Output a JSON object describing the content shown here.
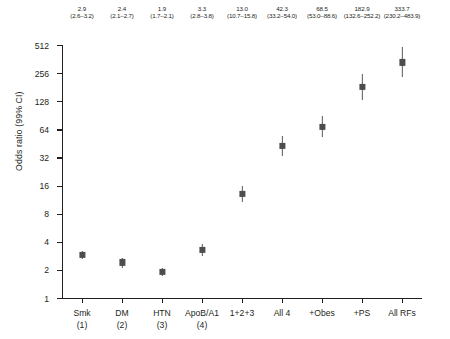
{
  "chart_data": {
    "type": "scatter",
    "title": "",
    "xlabel": "",
    "ylabel": "Odds ratio (99% CI)",
    "yscale": "log2",
    "ylim": [
      1,
      512
    ],
    "yticks": [
      1,
      2,
      4,
      8,
      16,
      32,
      64,
      128,
      256,
      512
    ],
    "ytick_labels": [
      "1",
      "2",
      "4",
      "8",
      "16",
      "32",
      "64",
      "128",
      "256",
      "512"
    ],
    "grid": false,
    "legend": null,
    "categories": [
      "Smk (1)",
      "DM (2)",
      "HTN (3)",
      "ApoB/A1 (4)",
      "1+2+3",
      "All 4",
      "+Obes",
      "+PS",
      "All RFs"
    ],
    "xtick_labels": [
      {
        "line1": "Smk",
        "line2": "(1)"
      },
      {
        "line1": "DM",
        "line2": "(2)"
      },
      {
        "line1": "HTN",
        "line2": "(3)"
      },
      {
        "line1": "ApoB/A1",
        "line2": "(4)"
      },
      {
        "line1": "1+2+3",
        "line2": ""
      },
      {
        "line1": "All 4",
        "line2": ""
      },
      {
        "line1": "+Obes",
        "line2": ""
      },
      {
        "line1": "+PS",
        "line2": ""
      },
      {
        "line1": "All RFs",
        "line2": ""
      }
    ],
    "values": [
      2.9,
      2.4,
      1.9,
      3.3,
      13.0,
      42.3,
      68.5,
      182.9,
      333.7
    ],
    "ci_low": [
      2.6,
      2.1,
      1.7,
      2.8,
      10.7,
      33.2,
      53.0,
      132.6,
      230.2
    ],
    "ci_high": [
      3.2,
      2.7,
      2.1,
      3.8,
      15.8,
      54.0,
      88.6,
      252.2,
      483.9
    ],
    "point_labels": [
      {
        "or": "2.9",
        "ci": "(2.6–3.2)"
      },
      {
        "or": "2.4",
        "ci": "(2.1–2.7)"
      },
      {
        "or": "1.9",
        "ci": "(1.7–2.1)"
      },
      {
        "or": "3.3",
        "ci": "(2.8–3.8)"
      },
      {
        "or": "13.0",
        "ci": "(10.7–15.8)"
      },
      {
        "or": "42.3",
        "ci": "(33.2–54.0)"
      },
      {
        "or": "68.5",
        "ci": "(53.0–88.6)"
      },
      {
        "or": "182.9",
        "ci": "(132.6–252.2)"
      },
      {
        "or": "333.7",
        "ci": "(230.2–483.9)"
      }
    ],
    "colors": {
      "marker": "#4d4d4f",
      "errorbar": "#58595b",
      "axis": "#231f20",
      "text": "#231f20",
      "background": "#ffffff"
    }
  }
}
